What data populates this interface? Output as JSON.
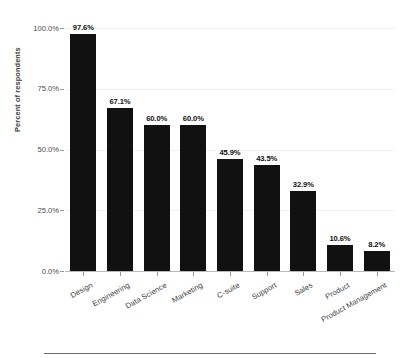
{
  "chart_data": {
    "type": "bar",
    "title": "",
    "subtitle": "",
    "xlabel": "",
    "ylabel": "Percent of respondents",
    "ylim": [
      0,
      100
    ],
    "grid": true,
    "legend": null,
    "orientation": "vertical",
    "bar_color": "#111111",
    "gridline_color": "#f1f1f1",
    "axis_color": "#b9b9b9",
    "value_label_format": "percent_one_decimal",
    "categories": [
      "Design",
      "Engineering",
      "Data Science",
      "Marketing",
      "C-suite",
      "Support",
      "Sales",
      "Product",
      "Product Management"
    ],
    "values": [
      97.6,
      67.1,
      60.0,
      60.0,
      45.9,
      43.5,
      32.9,
      10.6,
      8.2
    ],
    "value_labels": [
      "97.6%",
      "67.1%",
      "60.0%",
      "60.0%",
      "45.9%",
      "43.5%",
      "32.9%",
      "10.6%",
      "8.2%"
    ],
    "yticks": [
      0,
      25,
      50,
      75,
      100
    ],
    "ytick_labels": [
      "0.0%",
      "25.0%",
      "50.0%",
      "75.0%",
      "100.0%"
    ]
  }
}
